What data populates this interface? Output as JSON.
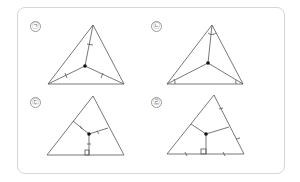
{
  "figures": [
    {
      "label": "㉠",
      "description": "Triangle with segments from center point to vertices, equal-length tick marks on each segment"
    },
    {
      "label": "㉡",
      "description": "Triangle with segments from center point to vertices, bisecting each angle with equal angle marks"
    },
    {
      "label": "㉢",
      "description": "Triangle with perpendicular segments from center point to each side, equal-length tick marks"
    },
    {
      "label": "㉣",
      "description": "Triangle with perpendicular segments from center point to each side midpoint, sides marked equal halves"
    }
  ],
  "colors": {
    "line": "#555555",
    "point": "#111111",
    "border": "#d6d6d6"
  }
}
